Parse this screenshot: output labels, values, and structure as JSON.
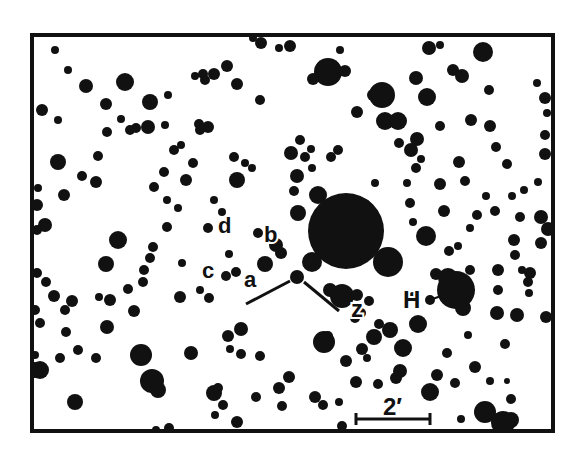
{
  "chart": {
    "frame": {
      "x": 32,
      "y": 35,
      "width": 521,
      "height": 396,
      "stroke": "#111111",
      "stroke_width": 4
    },
    "ink_color": "#111111",
    "background": "#ffffff"
  },
  "labels": [
    {
      "id": "a",
      "text": "a",
      "x": 244,
      "y": 287,
      "size": 22
    },
    {
      "id": "b",
      "text": "b",
      "x": 264,
      "y": 242,
      "size": 22
    },
    {
      "id": "c",
      "text": "c",
      "x": 202,
      "y": 278,
      "size": 22
    },
    {
      "id": "d",
      "text": "d",
      "x": 218,
      "y": 233,
      "size": 22
    },
    {
      "id": "z",
      "text": "z",
      "x": 351,
      "y": 317,
      "size": 24
    },
    {
      "id": "H",
      "text": "H",
      "x": 403,
      "y": 308,
      "size": 24
    }
  ],
  "scale_bar": {
    "label": "2′",
    "x1": 356,
    "x2": 430,
    "y": 419,
    "label_x": 383,
    "label_y": 415,
    "label_size": 24
  },
  "markers": [
    {
      "name": "target-pointer-left",
      "x1": 246,
      "y1": 304,
      "x2": 290,
      "y2": 281
    },
    {
      "name": "target-pointer-right",
      "x1": 304,
      "y1": 282,
      "x2": 339,
      "y2": 311
    },
    {
      "name": "h-pointer",
      "x1": 427,
      "y1": 301,
      "x2": 441,
      "y2": 296
    }
  ],
  "stars": [
    [
      328,
      72,
      14
    ],
    [
      382,
      95,
      13
    ],
    [
      483,
      52,
      10
    ],
    [
      125,
      82,
      9
    ],
    [
      237,
      180,
      8
    ],
    [
      118,
      240,
      9
    ],
    [
      106,
      264,
      8
    ],
    [
      141,
      355,
      11
    ],
    [
      152,
      381,
      12
    ],
    [
      58,
      162,
      8
    ],
    [
      64,
      195,
      6
    ],
    [
      45,
      225,
      7
    ],
    [
      46,
      282,
      5
    ],
    [
      72,
      301,
      6
    ],
    [
      82,
      176,
      5
    ],
    [
      96,
      182,
      6
    ],
    [
      60,
      358,
      5
    ],
    [
      40,
      370,
      9
    ],
    [
      75,
      402,
      8
    ],
    [
      78,
      350,
      5
    ],
    [
      158,
      390,
      8
    ],
    [
      346,
      231,
      38
    ],
    [
      360,
      212,
      14
    ],
    [
      318,
      195,
      9
    ],
    [
      298,
      213,
      8
    ],
    [
      312,
      262,
      10
    ],
    [
      388,
      262,
      15
    ],
    [
      426,
      236,
      10
    ],
    [
      385,
      121,
      9
    ],
    [
      398,
      121,
      9
    ],
    [
      373,
      95,
      6
    ],
    [
      456,
      290,
      19
    ],
    [
      448,
      278,
      10
    ],
    [
      463,
      308,
      8
    ],
    [
      436,
      274,
      6
    ],
    [
      297,
      277,
      7
    ],
    [
      281,
      253,
      6
    ],
    [
      265,
      264,
      8
    ],
    [
      276,
      245,
      7
    ],
    [
      258,
      233,
      5
    ],
    [
      226,
      276,
      5
    ],
    [
      236,
      272,
      5
    ],
    [
      229,
      254,
      4
    ],
    [
      342,
      296,
      12
    ],
    [
      330,
      290,
      7
    ],
    [
      357,
      295,
      6
    ],
    [
      361,
      313,
      5
    ],
    [
      369,
      301,
      5
    ],
    [
      290,
      46,
      6
    ],
    [
      261,
      43,
      6
    ],
    [
      253,
      38,
      4
    ],
    [
      227,
      66,
      6
    ],
    [
      214,
      74,
      6
    ],
    [
      203,
      74,
      5
    ],
    [
      205,
      80,
      5
    ],
    [
      237,
      84,
      6
    ],
    [
      195,
      76,
      4
    ],
    [
      208,
      127,
      6
    ],
    [
      200,
      130,
      5
    ],
    [
      193,
      163,
      5
    ],
    [
      186,
      180,
      6
    ],
    [
      167,
      200,
      4
    ],
    [
      178,
      208,
      4
    ],
    [
      313,
      79,
      6
    ],
    [
      326,
      72,
      5
    ],
    [
      345,
      71,
      6
    ],
    [
      357,
      112,
      6
    ],
    [
      340,
      50,
      4
    ],
    [
      260,
      100,
      5
    ],
    [
      305,
      157,
      5
    ],
    [
      312,
      168,
      4
    ],
    [
      331,
      157,
      5
    ],
    [
      427,
      97,
      9
    ],
    [
      416,
      78,
      7
    ],
    [
      429,
      48,
      7
    ],
    [
      440,
      45,
      4
    ],
    [
      453,
      70,
      6
    ],
    [
      462,
      76,
      7
    ],
    [
      471,
      120,
      6
    ],
    [
      490,
      126,
      6
    ],
    [
      496,
      147,
      5
    ],
    [
      489,
      90,
      5
    ],
    [
      545,
      98,
      6
    ],
    [
      545,
      154,
      6
    ],
    [
      507,
      164,
      5
    ],
    [
      537,
      83,
      4
    ],
    [
      548,
      229,
      7
    ],
    [
      541,
      217,
      7
    ],
    [
      541,
      243,
      6
    ],
    [
      514,
      240,
      6
    ],
    [
      515,
      255,
      5
    ],
    [
      530,
      273,
      6
    ],
    [
      528,
      282,
      5
    ],
    [
      522,
      270,
      4
    ],
    [
      498,
      270,
      6
    ],
    [
      470,
      270,
      5
    ],
    [
      444,
      211,
      6
    ],
    [
      440,
      184,
      6
    ],
    [
      410,
      203,
      5
    ],
    [
      387,
      256,
      5
    ],
    [
      411,
      150,
      7
    ],
    [
      417,
      139,
      7
    ],
    [
      440,
      126,
      5
    ],
    [
      399,
      143,
      5
    ],
    [
      413,
      222,
      4
    ],
    [
      465,
      181,
      5
    ],
    [
      459,
      162,
      6
    ],
    [
      520,
      217,
      5
    ],
    [
      512,
      196,
      4
    ],
    [
      538,
      182,
      4
    ],
    [
      497,
      313,
      7
    ],
    [
      517,
      315,
      7
    ],
    [
      546,
      317,
      6
    ],
    [
      403,
      348,
      9
    ],
    [
      418,
      324,
      9
    ],
    [
      390,
      330,
      8
    ],
    [
      374,
      337,
      8
    ],
    [
      362,
      349,
      6
    ],
    [
      355,
      318,
      5
    ],
    [
      379,
      324,
      5
    ],
    [
      400,
      371,
      7
    ],
    [
      396,
      378,
      6
    ],
    [
      378,
      384,
      5
    ],
    [
      346,
      361,
      6
    ],
    [
      324,
      342,
      11
    ],
    [
      328,
      336,
      5
    ],
    [
      356,
      382,
      6
    ],
    [
      367,
      358,
      4
    ],
    [
      475,
      367,
      6
    ],
    [
      455,
      383,
      5
    ],
    [
      437,
      375,
      6
    ],
    [
      430,
      392,
      9
    ],
    [
      485,
      412,
      11
    ],
    [
      503,
      423,
      12
    ],
    [
      511,
      420,
      8
    ],
    [
      461,
      419,
      4
    ],
    [
      505,
      344,
      5
    ],
    [
      511,
      399,
      5
    ],
    [
      279,
      388,
      6
    ],
    [
      289,
      377,
      6
    ],
    [
      315,
      397,
      6
    ],
    [
      228,
      336,
      6
    ],
    [
      241,
      329,
      7
    ],
    [
      230,
      349,
      4
    ],
    [
      241,
      354,
      5
    ],
    [
      209,
      298,
      5
    ],
    [
      180,
      297,
      6
    ],
    [
      200,
      290,
      4
    ],
    [
      191,
      353,
      7
    ],
    [
      214,
      393,
      8
    ],
    [
      218,
      388,
      5
    ],
    [
      237,
      422,
      6
    ],
    [
      223,
      405,
      5
    ],
    [
      256,
      397,
      5
    ],
    [
      260,
      356,
      5
    ],
    [
      282,
      406,
      5
    ],
    [
      215,
      415,
      4
    ],
    [
      323,
      405,
      5
    ],
    [
      339,
      402,
      4
    ],
    [
      342,
      426,
      5
    ],
    [
      169,
      428,
      5
    ],
    [
      156,
      430,
      4
    ],
    [
      107,
      327,
      7
    ],
    [
      96,
      358,
      5
    ],
    [
      134,
      311,
      6
    ],
    [
      99,
      297,
      4
    ],
    [
      110,
      300,
      6
    ],
    [
      128,
      289,
      5
    ],
    [
      65,
      310,
      5
    ],
    [
      66,
      332,
      5
    ],
    [
      35,
      370,
      8
    ],
    [
      37,
      230,
      5
    ],
    [
      37,
      205,
      6
    ],
    [
      38,
      188,
      4
    ],
    [
      37,
      273,
      5
    ],
    [
      40,
      323,
      5
    ],
    [
      35,
      355,
      4
    ],
    [
      35,
      310,
      5
    ],
    [
      55,
      50,
      4
    ],
    [
      68,
      70,
      4
    ],
    [
      42,
      110,
      6
    ],
    [
      86,
      86,
      7
    ],
    [
      106,
      104,
      6
    ],
    [
      150,
      102,
      8
    ],
    [
      136,
      128,
      5
    ],
    [
      107,
      132,
      5
    ],
    [
      98,
      156,
      5
    ],
    [
      58,
      120,
      4
    ],
    [
      121,
      119,
      4
    ],
    [
      168,
      95,
      4
    ],
    [
      199,
      124,
      5
    ],
    [
      130,
      130,
      5
    ],
    [
      148,
      127,
      7
    ],
    [
      165,
      125,
      4
    ],
    [
      174,
      150,
      5
    ],
    [
      164,
      172,
      5
    ],
    [
      154,
      187,
      5
    ],
    [
      208,
      228,
      5
    ],
    [
      214,
      200,
      4
    ],
    [
      167,
      227,
      5
    ],
    [
      153,
      247,
      5
    ],
    [
      150,
      258,
      5
    ],
    [
      222,
      212,
      4
    ],
    [
      182,
      263,
      4
    ],
    [
      144,
      270,
      5
    ],
    [
      143,
      282,
      5
    ],
    [
      109,
      299,
      4
    ],
    [
      54,
      296,
      6
    ],
    [
      234,
      157,
      5
    ],
    [
      245,
      163,
      4
    ],
    [
      252,
      168,
      4
    ],
    [
      181,
      145,
      4
    ],
    [
      279,
      48,
      4
    ],
    [
      291,
      153,
      7
    ],
    [
      300,
      140,
      5
    ],
    [
      297,
      176,
      7
    ],
    [
      294,
      191,
      5
    ],
    [
      311,
      149,
      4
    ],
    [
      338,
      150,
      5
    ],
    [
      375,
      183,
      4
    ],
    [
      407,
      183,
      4
    ],
    [
      416,
      168,
      5
    ],
    [
      421,
      159,
      4
    ],
    [
      477,
      215,
      5
    ],
    [
      449,
      251,
      5
    ],
    [
      458,
      246,
      4
    ],
    [
      470,
      228,
      4
    ],
    [
      486,
      196,
      4
    ],
    [
      495,
      211,
      5
    ],
    [
      524,
      190,
      4
    ],
    [
      545,
      135,
      5
    ],
    [
      547,
      113,
      4
    ],
    [
      498,
      290,
      5
    ],
    [
      529,
      293,
      4
    ],
    [
      430,
      300,
      5
    ],
    [
      413,
      296,
      4
    ],
    [
      468,
      335,
      4
    ],
    [
      490,
      381,
      4
    ],
    [
      507,
      381,
      3
    ],
    [
      447,
      353,
      5
    ]
  ]
}
